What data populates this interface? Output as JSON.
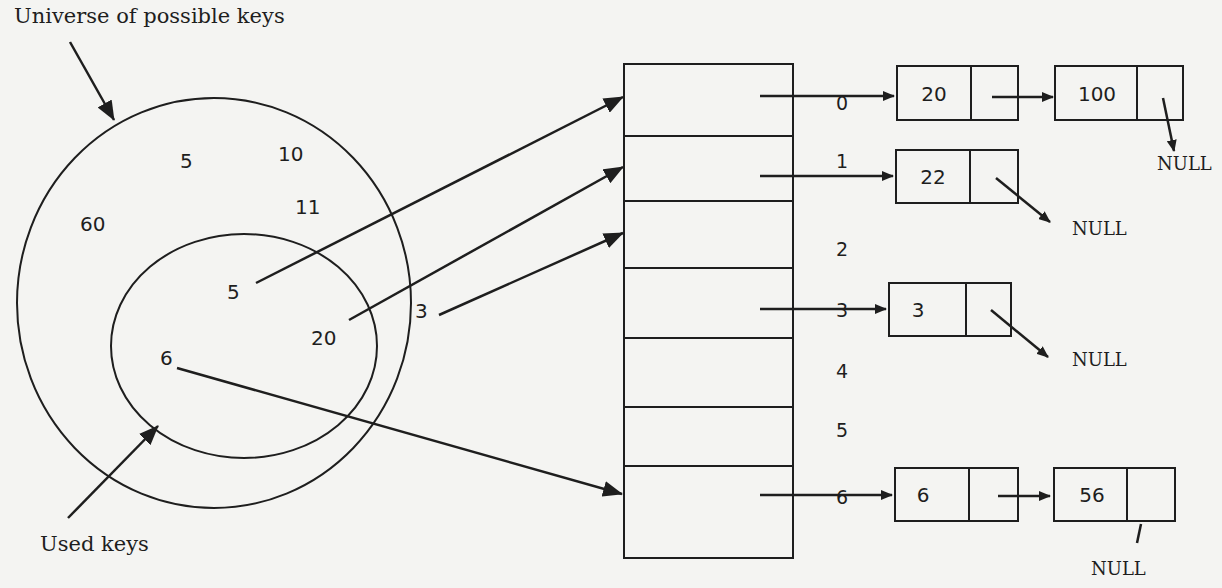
{
  "labels": {
    "universe": "Universe of possible keys",
    "used": "Used keys"
  },
  "universe_keys": [
    "5",
    "10",
    "11",
    "60"
  ],
  "used_keys": [
    "5",
    "20",
    "6"
  ],
  "extra_key": "3",
  "hash_table": {
    "indices": [
      "0",
      "1",
      "2",
      "3",
      "4",
      "5",
      "6"
    ]
  },
  "chains": {
    "bucket0": {
      "nodes": [
        "20",
        "100"
      ],
      "terminator": "NULL"
    },
    "bucket1": {
      "nodes": [
        "22"
      ],
      "terminator": "NULL"
    },
    "bucket3": {
      "nodes": [
        "3"
      ],
      "terminator": "NULL"
    },
    "bucket6": {
      "nodes": [
        "6",
        "56"
      ],
      "terminator": "NULL"
    }
  },
  "colors": {
    "ink": "#1e1e1e",
    "paper": "#f4f4f2"
  }
}
